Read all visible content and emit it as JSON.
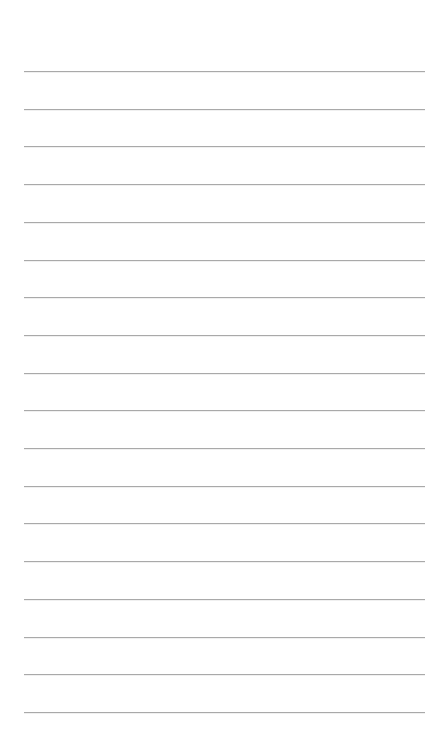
{
  "page": {
    "type": "lined-paper",
    "background_color": "#ffffff",
    "line_color": "#a9a9a9",
    "line_count": 18,
    "first_line_y": 71,
    "line_spacing": 37.7,
    "line_left": 24,
    "line_width": 401
  }
}
